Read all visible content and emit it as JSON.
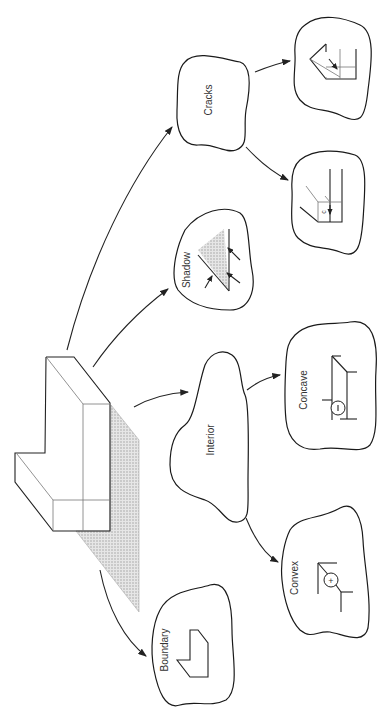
{
  "diagram": {
    "type": "edge-label taxonomy of a 3D block scene",
    "root": "L-shaped block with cast shadow",
    "nodes": [
      {
        "id": "boundary",
        "label": "Boundary"
      },
      {
        "id": "interior",
        "label": "Interior"
      },
      {
        "id": "shadow",
        "label": "Shadow"
      },
      {
        "id": "cracks",
        "label": "Cracks"
      },
      {
        "id": "convex",
        "label": "Convex",
        "symbol": "+"
      },
      {
        "id": "concave",
        "label": "Concave",
        "symbol": "−"
      },
      {
        "id": "crack-1",
        "label": "",
        "symbol": "arrow-pair"
      },
      {
        "id": "crack-2",
        "label": "",
        "symbol": "c"
      }
    ],
    "edges": [
      {
        "from": "root",
        "to": "boundary"
      },
      {
        "from": "root",
        "to": "interior"
      },
      {
        "from": "root",
        "to": "shadow"
      },
      {
        "from": "root",
        "to": "cracks"
      },
      {
        "from": "interior",
        "to": "convex"
      },
      {
        "from": "interior",
        "to": "concave"
      },
      {
        "from": "cracks",
        "to": "crack-1"
      },
      {
        "from": "cracks",
        "to": "crack-2"
      }
    ],
    "colors": {
      "line": "#222222",
      "shadow_fill": "#d6d6d6",
      "background": "#ffffff"
    }
  }
}
